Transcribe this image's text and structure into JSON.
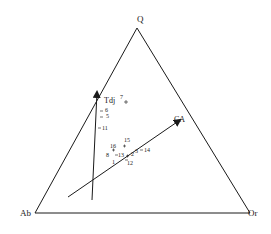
{
  "diagram": {
    "type": "ternary",
    "vertices": {
      "top": "Q",
      "left": "Ab",
      "right": "Or"
    },
    "group_labels": {
      "tdj": "Tdj",
      "ca": "CA"
    },
    "points": [
      {
        "id": "1",
        "label": "1"
      },
      {
        "id": "2",
        "label": "2"
      },
      {
        "id": "3",
        "label": "3"
      },
      {
        "id": "5",
        "label": "5"
      },
      {
        "id": "6",
        "label": "6"
      },
      {
        "id": "7",
        "label": "7"
      },
      {
        "id": "8",
        "label": "8"
      },
      {
        "id": "11",
        "label": "11"
      },
      {
        "id": "12",
        "label": "12"
      },
      {
        "id": "13",
        "label": "13"
      },
      {
        "id": "14",
        "label": "14"
      },
      {
        "id": "15",
        "label": "15"
      },
      {
        "id": "16",
        "label": "16"
      }
    ],
    "arrows": [
      {
        "name": "Tdj trend"
      },
      {
        "name": "CA trend"
      }
    ],
    "colors": {
      "line": "#1a1a1a",
      "background": "#ffffff"
    }
  }
}
